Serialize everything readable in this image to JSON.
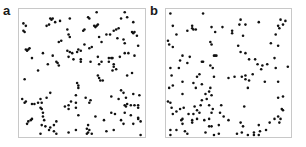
{
  "chart_data": [
    {
      "type": "scatter",
      "panel_label": "a",
      "title": "",
      "xlabel": "",
      "ylabel": "",
      "axes": "none",
      "grid": false,
      "legend": null,
      "note": "Clustered point pattern; coordinates normalized 0-1 within frame (x right, y down)",
      "dot_color": "#111111",
      "frame_color": "#c8c8c8",
      "points": [
        [
          0.62,
          0.01
        ],
        [
          0.24,
          0.06
        ],
        [
          0.25,
          0.07
        ],
        [
          0.26,
          0.06
        ],
        [
          0.4,
          0.06
        ],
        [
          0.55,
          0.05
        ],
        [
          0.56,
          0.06
        ],
        [
          0.82,
          0.06
        ],
        [
          0.87,
          0.05
        ],
        [
          0.85,
          0.01
        ],
        [
          0.02,
          0.1
        ],
        [
          0.04,
          0.12
        ],
        [
          0.21,
          0.12
        ],
        [
          0.23,
          0.11
        ],
        [
          0.28,
          0.09
        ],
        [
          0.32,
          0.08
        ],
        [
          0.6,
          0.12
        ],
        [
          0.61,
          0.13
        ],
        [
          0.62,
          0.12
        ],
        [
          0.63,
          0.11
        ],
        [
          0.92,
          0.09
        ],
        [
          0.02,
          0.16
        ],
        [
          0.03,
          0.17
        ],
        [
          0.38,
          0.15
        ],
        [
          0.51,
          0.16
        ],
        [
          0.52,
          0.15
        ],
        [
          0.78,
          0.15
        ],
        [
          0.8,
          0.14
        ],
        [
          0.91,
          0.17
        ],
        [
          0.92,
          0.18
        ],
        [
          0.93,
          0.17
        ],
        [
          0.76,
          0.16
        ],
        [
          0.73,
          0.19
        ],
        [
          0.39,
          0.19
        ],
        [
          0.4,
          0.21
        ],
        [
          0.64,
          0.21
        ],
        [
          0.7,
          0.19
        ],
        [
          0.79,
          0.22
        ],
        [
          0.84,
          0.23
        ],
        [
          0.95,
          0.2
        ],
        [
          0.31,
          0.25
        ],
        [
          0.33,
          0.24
        ],
        [
          0.52,
          0.27
        ],
        [
          0.56,
          0.3
        ],
        [
          0.58,
          0.29
        ],
        [
          0.66,
          0.25
        ],
        [
          0.85,
          0.26
        ],
        [
          0.96,
          0.28
        ],
        [
          0.04,
          0.31
        ],
        [
          0.05,
          0.32
        ],
        [
          0.06,
          0.31
        ],
        [
          0.07,
          0.3
        ],
        [
          0.38,
          0.32
        ],
        [
          0.4,
          0.33
        ],
        [
          0.42,
          0.34
        ],
        [
          0.46,
          0.33
        ],
        [
          0.47,
          0.31
        ],
        [
          0.49,
          0.32
        ],
        [
          0.85,
          0.34
        ],
        [
          0.88,
          0.34
        ],
        [
          0.18,
          0.34
        ],
        [
          0.26,
          0.36
        ],
        [
          0.39,
          0.37
        ],
        [
          0.43,
          0.39
        ],
        [
          0.49,
          0.39
        ],
        [
          0.63,
          0.37
        ],
        [
          0.72,
          0.38
        ],
        [
          0.74,
          0.38
        ],
        [
          0.75,
          0.38
        ],
        [
          0.81,
          0.37
        ],
        [
          0.93,
          0.36
        ],
        [
          0.09,
          0.38
        ],
        [
          0.49,
          0.41
        ],
        [
          0.57,
          0.41
        ],
        [
          0.66,
          0.41
        ],
        [
          0.72,
          0.41
        ],
        [
          0.76,
          0.43
        ],
        [
          0.22,
          0.43
        ],
        [
          0.29,
          0.41
        ],
        [
          0.3,
          0.42
        ],
        [
          0.31,
          0.44
        ],
        [
          0.64,
          0.43
        ],
        [
          0.76,
          0.45
        ],
        [
          0.78,
          0.47
        ],
        [
          0.14,
          0.48
        ],
        [
          0.63,
          0.52
        ],
        [
          0.64,
          0.54
        ],
        [
          0.65,
          0.56
        ],
        [
          0.67,
          0.56
        ],
        [
          0.87,
          0.52
        ],
        [
          0.91,
          0.5
        ],
        [
          0.75,
          0.48
        ],
        [
          0.03,
          0.55
        ],
        [
          0.46,
          0.58
        ],
        [
          0.47,
          0.6
        ],
        [
          0.47,
          0.62
        ],
        [
          0.24,
          0.66
        ],
        [
          0.82,
          0.64
        ],
        [
          0.84,
          0.66
        ],
        [
          0.92,
          0.67
        ],
        [
          0.21,
          0.7
        ],
        [
          0.45,
          0.68
        ],
        [
          0.53,
          0.7
        ],
        [
          0.74,
          0.69
        ],
        [
          0.8,
          0.71
        ],
        [
          0.86,
          0.7
        ],
        [
          0.97,
          0.68
        ],
        [
          0.01,
          0.71
        ],
        [
          0.03,
          0.74
        ],
        [
          0.04,
          0.73
        ],
        [
          0.14,
          0.74
        ],
        [
          0.16,
          0.71
        ],
        [
          0.17,
          0.74
        ],
        [
          0.39,
          0.76
        ],
        [
          0.41,
          0.73
        ],
        [
          0.45,
          0.74
        ],
        [
          0.45,
          0.78
        ],
        [
          0.56,
          0.74
        ],
        [
          0.57,
          0.72
        ],
        [
          0.09,
          0.75
        ],
        [
          0.11,
          0.75
        ],
        [
          0.16,
          0.78
        ],
        [
          0.17,
          0.79
        ],
        [
          0.36,
          0.77
        ],
        [
          0.39,
          0.79
        ],
        [
          0.85,
          0.76
        ],
        [
          0.86,
          0.77
        ],
        [
          0.87,
          0.75
        ],
        [
          0.9,
          0.76
        ],
        [
          0.93,
          0.76
        ],
        [
          0.96,
          0.76
        ],
        [
          0.96,
          0.78
        ],
        [
          0.18,
          0.82
        ],
        [
          0.47,
          0.84
        ],
        [
          0.61,
          0.85
        ],
        [
          0.74,
          0.82
        ],
        [
          0.77,
          0.83
        ],
        [
          0.85,
          0.82
        ],
        [
          0.9,
          0.84
        ],
        [
          0.96,
          0.86
        ],
        [
          0.96,
          0.87
        ],
        [
          0.18,
          0.85
        ],
        [
          0.06,
          0.89
        ],
        [
          0.08,
          0.88
        ],
        [
          0.09,
          0.87
        ],
        [
          0.19,
          0.88
        ],
        [
          0.29,
          0.89
        ],
        [
          0.68,
          0.88
        ],
        [
          0.82,
          0.88
        ],
        [
          0.98,
          0.89
        ],
        [
          0.05,
          0.91
        ],
        [
          0.17,
          0.92
        ],
        [
          0.2,
          0.93
        ],
        [
          0.24,
          0.94
        ],
        [
          0.27,
          0.92
        ],
        [
          0.55,
          0.92
        ],
        [
          0.84,
          0.91
        ],
        [
          0.92,
          0.91
        ],
        [
          0.23,
          0.96
        ],
        [
          0.27,
          0.97
        ],
        [
          0.45,
          0.96
        ],
        [
          0.54,
          0.95
        ],
        [
          0.56,
          0.96
        ],
        [
          0.7,
          0.97
        ],
        [
          0.76,
          0.96
        ],
        [
          0.16,
          0.99
        ],
        [
          0.29,
          0.99
        ],
        [
          0.39,
          0.98
        ],
        [
          0.54,
          0.99
        ],
        [
          0.55,
          0.98
        ],
        [
          0.58,
          0.99
        ],
        [
          0.98,
          1.0
        ]
      ]
    },
    {
      "type": "scatter",
      "panel_label": "b",
      "title": "",
      "xlabel": "",
      "ylabel": "",
      "axes": "none",
      "grid": false,
      "legend": null,
      "note": "Random (Poisson-like) point pattern; coordinates normalized 0-1 within frame (x right, y down)",
      "dot_color": "#111111",
      "frame_color": "#c8c8c8",
      "points": [
        [
          0.02,
          0.02
        ],
        [
          0.29,
          0.02
        ],
        [
          0.6,
          0.07
        ],
        [
          0.75,
          0.09
        ],
        [
          0.93,
          0.07
        ],
        [
          0.97,
          0.08
        ],
        [
          0.04,
          0.12
        ],
        [
          0.2,
          0.12
        ],
        [
          0.2,
          0.14
        ],
        [
          0.21,
          0.15
        ],
        [
          0.23,
          0.15
        ],
        [
          0.36,
          0.13
        ],
        [
          0.45,
          0.13
        ],
        [
          0.59,
          0.11
        ],
        [
          0.64,
          0.11
        ],
        [
          0.91,
          0.12
        ],
        [
          0.95,
          0.11
        ],
        [
          0.92,
          0.14
        ],
        [
          0.07,
          0.19
        ],
        [
          0.16,
          0.16
        ],
        [
          0.39,
          0.17
        ],
        [
          0.53,
          0.16
        ],
        [
          0.53,
          0.18
        ],
        [
          0.62,
          0.2
        ],
        [
          0.89,
          0.19
        ],
        [
          0.0,
          0.24
        ],
        [
          0.01,
          0.27
        ],
        [
          0.04,
          0.29
        ],
        [
          0.35,
          0.25
        ],
        [
          0.36,
          0.27
        ],
        [
          0.58,
          0.28
        ],
        [
          0.85,
          0.26
        ],
        [
          0.91,
          0.28
        ],
        [
          0.12,
          0.36
        ],
        [
          0.18,
          0.37
        ],
        [
          0.38,
          0.36
        ],
        [
          0.39,
          0.36
        ],
        [
          0.4,
          0.36
        ],
        [
          0.6,
          0.33
        ],
        [
          0.64,
          0.34
        ],
        [
          0.67,
          0.39
        ],
        [
          0.72,
          0.39
        ],
        [
          0.88,
          0.38
        ],
        [
          0.1,
          0.4
        ],
        [
          0.16,
          0.42
        ],
        [
          0.28,
          0.41
        ],
        [
          0.29,
          0.41
        ],
        [
          0.35,
          0.44
        ],
        [
          0.37,
          0.46
        ],
        [
          0.74,
          0.43
        ],
        [
          0.78,
          0.44
        ],
        [
          0.82,
          0.43
        ],
        [
          0.99,
          0.45
        ],
        [
          0.89,
          0.46
        ],
        [
          0.77,
          0.47
        ],
        [
          0.02,
          0.46
        ],
        [
          0.09,
          0.46
        ],
        [
          0.03,
          0.52
        ],
        [
          0.26,
          0.51
        ],
        [
          0.24,
          0.53
        ],
        [
          0.38,
          0.53
        ],
        [
          0.55,
          0.53
        ],
        [
          0.61,
          0.53
        ],
        [
          0.64,
          0.52
        ],
        [
          0.64,
          0.55
        ],
        [
          0.67,
          0.56
        ],
        [
          0.7,
          0.51
        ],
        [
          0.5,
          0.54
        ],
        [
          0.12,
          0.57
        ],
        [
          0.21,
          0.58
        ],
        [
          0.28,
          0.59
        ],
        [
          0.01,
          0.62
        ],
        [
          0.04,
          0.6
        ],
        [
          0.23,
          0.62
        ],
        [
          0.35,
          0.62
        ],
        [
          0.66,
          0.62
        ],
        [
          0.8,
          0.57
        ],
        [
          0.91,
          0.57
        ],
        [
          0.12,
          0.67
        ],
        [
          0.31,
          0.67
        ],
        [
          0.34,
          0.65
        ],
        [
          0.36,
          0.68
        ],
        [
          0.28,
          0.72
        ],
        [
          0.32,
          0.71
        ],
        [
          0.91,
          0.7
        ],
        [
          0.0,
          0.73
        ],
        [
          0.02,
          0.74
        ],
        [
          0.03,
          0.78
        ],
        [
          0.07,
          0.81
        ],
        [
          0.1,
          0.79
        ],
        [
          0.13,
          0.78
        ],
        [
          0.22,
          0.77
        ],
        [
          0.24,
          0.8
        ],
        [
          0.27,
          0.76
        ],
        [
          0.34,
          0.76
        ],
        [
          0.44,
          0.76
        ],
        [
          0.63,
          0.77
        ],
        [
          0.95,
          0.69
        ],
        [
          0.04,
          0.83
        ],
        [
          0.17,
          0.83
        ],
        [
          0.21,
          0.83
        ],
        [
          0.26,
          0.82
        ],
        [
          0.36,
          0.82
        ],
        [
          0.37,
          0.79
        ],
        [
          0.43,
          0.82
        ],
        [
          0.46,
          0.85
        ],
        [
          0.94,
          0.79
        ],
        [
          0.95,
          0.8
        ],
        [
          0.11,
          0.88
        ],
        [
          0.12,
          0.87
        ],
        [
          0.2,
          0.88
        ],
        [
          0.24,
          0.87
        ],
        [
          0.3,
          0.88
        ],
        [
          0.34,
          0.87
        ],
        [
          0.42,
          0.92
        ],
        [
          0.5,
          0.88
        ],
        [
          0.6,
          0.9
        ],
        [
          0.88,
          0.87
        ],
        [
          0.91,
          0.85
        ],
        [
          0.93,
          0.87
        ],
        [
          0.12,
          0.91
        ],
        [
          0.2,
          0.9
        ],
        [
          0.34,
          0.93
        ],
        [
          0.36,
          0.93
        ],
        [
          0.62,
          0.93
        ],
        [
          0.75,
          0.92
        ],
        [
          0.84,
          0.9
        ],
        [
          0.92,
          0.9
        ],
        [
          0.02,
          0.96
        ],
        [
          0.07,
          0.96
        ],
        [
          0.14,
          0.97
        ],
        [
          0.31,
          0.98
        ],
        [
          0.42,
          0.99
        ],
        [
          0.57,
          0.99
        ],
        [
          0.61,
          0.98
        ],
        [
          0.71,
          0.98
        ],
        [
          0.76,
          0.97
        ],
        [
          0.81,
          0.96
        ],
        [
          0.02,
          1.0
        ],
        [
          0.16,
          0.99
        ],
        [
          0.38,
          1.0
        ],
        [
          0.66,
          1.0
        ],
        [
          0.71,
          1.0
        ],
        [
          0.75,
          1.0
        ]
      ]
    }
  ],
  "panels": {
    "a": {
      "label": "a"
    },
    "b": {
      "label": "b"
    }
  }
}
